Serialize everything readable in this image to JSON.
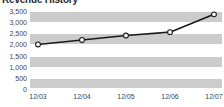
{
  "chart_data": {
    "type": "line",
    "title": "Revenue History",
    "xlabel": "",
    "ylabel": "",
    "categories": [
      "12/03",
      "12/04",
      "12/05",
      "12/06",
      "12/07"
    ],
    "values": [
      2000,
      2200,
      2400,
      2550,
      3350
    ],
    "series": [
      {
        "name": "Revenue",
        "values": [
          2000,
          2200,
          2400,
          2550,
          3350
        ]
      }
    ],
    "ylim": [
      0,
      3500
    ],
    "ytick_values": [
      0,
      500,
      1000,
      1500,
      2000,
      2500,
      3000,
      3500
    ],
    "ytick_labels": [
      "0",
      "500",
      "1,000",
      "1,500",
      "2,000",
      "2,500",
      "3,000",
      "3,500"
    ],
    "grid": true,
    "legend": "none",
    "marker": "circle-open",
    "colors": {
      "line": "#1a1a1a",
      "marker_fill": "#ffffff",
      "band": "#cccccc",
      "gridline": "#ffffff",
      "plot_background": "#ffffff",
      "text": "#444444",
      "title": "#2b2b2b"
    }
  }
}
